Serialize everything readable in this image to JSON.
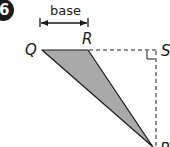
{
  "question": {
    "number": "6"
  },
  "diagram": {
    "base_label": "base",
    "vertices": {
      "Q": "Q",
      "R": "R",
      "S": "S",
      "P": "P"
    },
    "colors": {
      "triangle_fill": "#a9a9a9",
      "stroke": "#1a1a1a",
      "badge": "#1a1a1a"
    }
  }
}
